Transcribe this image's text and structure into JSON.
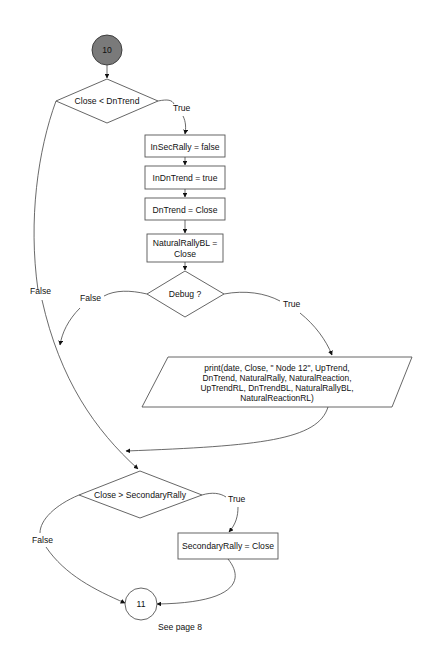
{
  "diagram": {
    "type": "flowchart",
    "connector_start": {
      "label": "10",
      "fill": "#7a7a7a"
    },
    "connector_end": {
      "label": "11",
      "note": "See page 8"
    },
    "nodes": {
      "decision1": "Close < DnTrend",
      "process1": "InSecRally = false",
      "process2": "InDnTrend = true",
      "process3": "DnTrend = Close",
      "process4_line1": "NaturalRallyBL =",
      "process4_line2": "Close",
      "decision2": "Debug ?",
      "io_line1": "print(date, Close, \" Node 12\", UpTrend,",
      "io_line2": "DnTrend, NaturalRally, NaturalReaction,",
      "io_line3": "UpTrendRL, DnTrendBL, NaturalRallyBL,",
      "io_line4": "NaturalReactionRL)",
      "decision3": "Close > SecondaryRally",
      "process5": "SecondaryRally = Close"
    },
    "edge_labels": {
      "d1_true": "True",
      "d1_false": "False",
      "d2_true": "True",
      "d2_false": "False",
      "d3_true": "True",
      "d3_false": "False"
    }
  }
}
